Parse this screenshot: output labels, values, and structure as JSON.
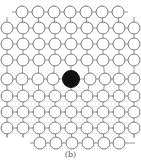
{
  "figure": {
    "caption": "(b)",
    "colors": {
      "background": "#ffffff",
      "bond": "#8a8a8a",
      "atom_stroke": "#7a7a7a",
      "atom_fill": "#ffffff",
      "defect_fill": "#111111"
    },
    "atom_radius": 6,
    "defect_radius": 8.5,
    "rows": [
      {
        "y": 12,
        "xs": [
          22,
          38,
          54,
          70,
          86,
          102,
          118
        ],
        "stub_left": 12,
        "stub_right": 128,
        "stubs_up": false
      },
      {
        "y": 28,
        "xs": [
          7,
          23,
          39,
          55,
          71,
          87,
          103,
          119,
          134
        ],
        "stubs_up_at": [
          7,
          134
        ]
      },
      {
        "y": 44,
        "xs": [
          7,
          23,
          39,
          55,
          71,
          87,
          103,
          119,
          134
        ]
      },
      {
        "y": 60,
        "xs": [
          7,
          23,
          39,
          55,
          71,
          87,
          103,
          119,
          134
        ]
      },
      {
        "y": 79,
        "xs": [
          7,
          22,
          38,
          53,
          71,
          90,
          105,
          119,
          134
        ],
        "defect_index": 4
      },
      {
        "y": 96,
        "xs": [
          7,
          23,
          39,
          55,
          71,
          87,
          103,
          119,
          134
        ]
      },
      {
        "y": 112,
        "xs": [
          7,
          23,
          39,
          55,
          71,
          87,
          103,
          119,
          134
        ]
      },
      {
        "y": 128,
        "xs": [
          7,
          23,
          39,
          55,
          71,
          87,
          103,
          119,
          134
        ],
        "stubs_down_at": [
          7,
          23,
          134
        ]
      },
      {
        "y": 143,
        "xs": [
          40,
          56,
          72,
          88,
          104,
          119
        ],
        "stub_left": 30,
        "stub_right": 135
      }
    ]
  }
}
